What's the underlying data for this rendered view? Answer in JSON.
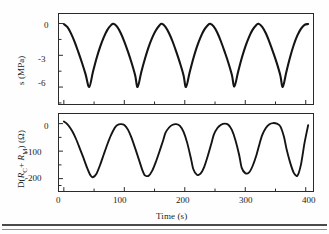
{
  "figure": {
    "background_color": "#fefefe",
    "trace_color": "#141414",
    "axis_color": "#2a2a2a"
  },
  "xaxis": {
    "label": "Time (s)",
    "ticks": [
      "0",
      "100",
      "200",
      "300",
      "400"
    ],
    "range": [
      -8,
      412
    ]
  },
  "panels": {
    "top": {
      "ylabel": "s (MPa)",
      "yticks": [
        "0",
        "-3",
        "-6"
      ],
      "range": [
        -7.6,
        0.9
      ]
    },
    "bottom": {
      "ylabel_prefix": "D(",
      "ylabel_r1": "R",
      "ylabel_r1_sub": "C",
      "ylabel_plus": "+ ",
      "ylabel_r2": "R",
      "ylabel_r2_sub": "M",
      "ylabel_suffix": ") (Ω)",
      "ylabel_plain": "D(R C + R M ) (Ω)",
      "yticks": [
        "0",
        "-100",
        "-200"
      ],
      "range": [
        -245,
        35
      ]
    }
  },
  "chart_data": [
    {
      "type": "line",
      "panel": "top",
      "title": "",
      "xlabel": "Time (s)",
      "ylabel": "s (MPa)",
      "xlim": [
        -8,
        412
      ],
      "ylim": [
        -7.6,
        0.9
      ],
      "xticks": [
        0,
        100,
        200,
        300,
        400
      ],
      "yticks": [
        0,
        -3,
        -6
      ],
      "grid": false,
      "legend": null,
      "series": [
        {
          "name": "stress",
          "comment": "5 cycles, period 80 s, rounded maxima near 0 MPa, sharp V minima near -6 MPa",
          "x": [
            0,
            6,
            12,
            18,
            24,
            30,
            36,
            42,
            48,
            54,
            60,
            66,
            72,
            78,
            82,
            88,
            94,
            100,
            106,
            112,
            118,
            122,
            128,
            134,
            140,
            146,
            152,
            158,
            162,
            168,
            174,
            180,
            186,
            192,
            198,
            202,
            208,
            214,
            220,
            226,
            232,
            238,
            242,
            248,
            254,
            260,
            266,
            272,
            278,
            282,
            288,
            294,
            300,
            306,
            312,
            318,
            322,
            328,
            334,
            340,
            346,
            352,
            358,
            362,
            368,
            374,
            380,
            386,
            392,
            398,
            404
          ],
          "y": [
            -0.05,
            -0.35,
            -0.95,
            -1.75,
            -2.7,
            -3.7,
            -4.8,
            -6.0,
            -4.6,
            -3.3,
            -2.2,
            -1.3,
            -0.6,
            -0.15,
            -0.02,
            -0.3,
            -0.9,
            -1.7,
            -2.65,
            -3.7,
            -4.9,
            -6.0,
            -4.6,
            -3.35,
            -2.25,
            -1.35,
            -0.65,
            -0.18,
            -0.03,
            -0.32,
            -0.92,
            -1.72,
            -2.68,
            -3.72,
            -4.9,
            -6.0,
            -4.62,
            -3.32,
            -2.2,
            -1.3,
            -0.6,
            -0.16,
            -0.02,
            -0.3,
            -0.9,
            -1.72,
            -2.68,
            -3.7,
            -4.88,
            -5.95,
            -4.6,
            -3.3,
            -2.2,
            -1.3,
            -0.6,
            -0.16,
            -0.02,
            -0.32,
            -0.92,
            -1.75,
            -2.7,
            -3.72,
            -4.9,
            -5.98,
            -4.55,
            -3.2,
            -2.05,
            -1.15,
            -0.5,
            -0.12,
            -0.05
          ]
        }
      ]
    },
    {
      "type": "line",
      "panel": "bottom",
      "title": "",
      "xlabel": "Time (s)",
      "ylabel": "D(R_C + R_M) (Ω)",
      "xlim": [
        -8,
        412
      ],
      "ylim": [
        -245,
        35
      ],
      "xticks": [
        0,
        100,
        200,
        300,
        400
      ],
      "yticks": [
        0,
        -100,
        -200
      ],
      "grid": false,
      "legend": null,
      "series": [
        {
          "name": "resistance change",
          "comment": "5 cycles, period 80 s, noisy flat-topped maxima near 0 ohm, rounded minima near -190 ohm",
          "x": [
            0,
            4,
            8,
            14,
            20,
            26,
            32,
            38,
            44,
            48,
            54,
            60,
            66,
            72,
            78,
            84,
            88,
            94,
            100,
            106,
            112,
            118,
            124,
            130,
            134,
            140,
            146,
            152,
            158,
            164,
            168,
            174,
            180,
            186,
            192,
            198,
            204,
            210,
            214,
            220,
            226,
            232,
            238,
            244,
            248,
            254,
            260,
            266,
            272,
            278,
            284,
            290,
            294,
            300,
            306,
            312,
            318,
            324,
            328,
            334,
            340,
            346,
            352,
            358,
            364,
            368,
            374,
            380,
            386,
            392,
            398,
            404
          ],
          "y": [
            8,
            2,
            -8,
            -28,
            -55,
            -88,
            -122,
            -158,
            -188,
            -195,
            -182,
            -150,
            -112,
            -75,
            -42,
            -16,
            -6,
            -2,
            -5,
            -22,
            -52,
            -90,
            -130,
            -170,
            -188,
            -190,
            -172,
            -140,
            -102,
            -62,
            -34,
            -14,
            -4,
            -2,
            -8,
            -30,
            -70,
            -125,
            -165,
            -186,
            -182,
            -158,
            -118,
            -72,
            -40,
            -16,
            -4,
            0,
            -4,
            -24,
            -62,
            -115,
            -160,
            -180,
            -178,
            -155,
            -118,
            -70,
            -42,
            -16,
            -2,
            2,
            0,
            -10,
            -48,
            -90,
            -140,
            -178,
            -190,
            -150,
            -70,
            -6
          ]
        }
      ]
    }
  ]
}
